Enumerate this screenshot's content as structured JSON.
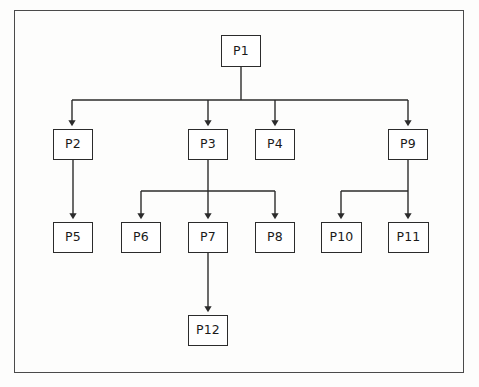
{
  "diagram": {
    "title": "",
    "type": "tree",
    "background_color": "#fdfdfc",
    "border_color": "#4a4a4a",
    "node_border_color": "#2b2b2b",
    "node_fill_color": "#ffffff",
    "edge_color": "#2b2b2b",
    "nodes": [
      {
        "id": "P1",
        "label": "P1",
        "x": 221,
        "y": 35,
        "w": 40,
        "h": 32,
        "level": 0
      },
      {
        "id": "P2",
        "label": "P2",
        "x": 53,
        "y": 129,
        "w": 40,
        "h": 31,
        "level": 1
      },
      {
        "id": "P3",
        "label": "P3",
        "x": 188,
        "y": 129,
        "w": 40,
        "h": 31,
        "level": 1
      },
      {
        "id": "P4",
        "label": "P4",
        "x": 255,
        "y": 129,
        "w": 40,
        "h": 31,
        "level": 1
      },
      {
        "id": "P9",
        "label": "P9",
        "x": 388,
        "y": 129,
        "w": 40,
        "h": 31,
        "level": 1
      },
      {
        "id": "P5",
        "label": "P5",
        "x": 53,
        "y": 222,
        "w": 40,
        "h": 31,
        "level": 2
      },
      {
        "id": "P6",
        "label": "P6",
        "x": 121,
        "y": 222,
        "w": 40,
        "h": 31,
        "level": 2
      },
      {
        "id": "P7",
        "label": "P7",
        "x": 188,
        "y": 222,
        "w": 40,
        "h": 31,
        "level": 2
      },
      {
        "id": "P8",
        "label": "P8",
        "x": 255,
        "y": 222,
        "w": 40,
        "h": 31,
        "level": 2
      },
      {
        "id": "P10",
        "label": "P10",
        "x": 321,
        "y": 222,
        "w": 41,
        "h": 31,
        "level": 2
      },
      {
        "id": "P11",
        "label": "P11",
        "x": 388,
        "y": 222,
        "w": 41,
        "h": 31,
        "level": 2
      },
      {
        "id": "P12",
        "label": "P12",
        "x": 188,
        "y": 315,
        "w": 40,
        "h": 31,
        "level": 3
      }
    ],
    "edges": [
      {
        "from": "P1",
        "to": "P2",
        "style": "orthogonal-bus"
      },
      {
        "from": "P1",
        "to": "P3",
        "style": "orthogonal-bus"
      },
      {
        "from": "P1",
        "to": "P4",
        "style": "orthogonal-bus"
      },
      {
        "from": "P1",
        "to": "P9",
        "style": "orthogonal-bus"
      },
      {
        "from": "P2",
        "to": "P5",
        "style": "straight"
      },
      {
        "from": "P3",
        "to": "P6",
        "style": "orthogonal-bus"
      },
      {
        "from": "P3",
        "to": "P7",
        "style": "straight"
      },
      {
        "from": "P3",
        "to": "P8",
        "style": "orthogonal-bus"
      },
      {
        "from": "P9",
        "to": "P10",
        "style": "orthogonal-bus"
      },
      {
        "from": "P9",
        "to": "P11",
        "style": "straight"
      },
      {
        "from": "P7",
        "to": "P12",
        "style": "straight"
      }
    ],
    "buses": [
      {
        "name": "root-bus",
        "y": 100,
        "x1": 72,
        "x2": 408,
        "source_x": 241
      },
      {
        "name": "p3-bus",
        "y": 191,
        "x1": 141,
        "x2": 275,
        "source_x": 208
      },
      {
        "name": "p9-bus",
        "y": 191,
        "x1": 341,
        "x2": 408,
        "source_x": 408
      }
    ]
  }
}
